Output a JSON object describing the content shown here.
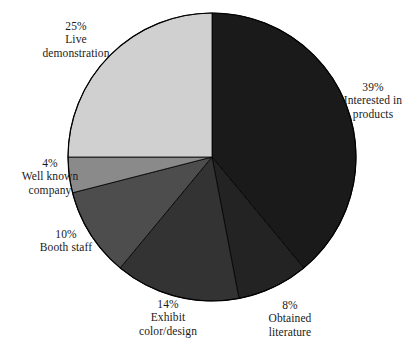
{
  "chart_data": {
    "type": "pie",
    "title": "",
    "subtitle": "",
    "xlabel": "",
    "ylabel": "",
    "legend_position": "none",
    "grid": false,
    "start_angle_deg": 0,
    "direction": "clockwise",
    "units": "percent",
    "total": 100,
    "categories": [
      "Interested in products",
      "Obtained literature",
      "Exhibit color/design",
      "Booth staff",
      "Well known company",
      "Live demonstration"
    ],
    "values": [
      39,
      8,
      14,
      10,
      4,
      25
    ],
    "colors": [
      "#1a1a1a",
      "#232323",
      "#333333",
      "#4d4d4d",
      "#8a8a8a",
      "#d0d0d0"
    ],
    "slices": [
      {
        "percent_text": "39%",
        "name_line1": "Interested in",
        "name_line2": "products",
        "name": "Interested in products",
        "value": 39,
        "color": "#1a1a1a",
        "start_deg": 0,
        "end_deg": 140.4
      },
      {
        "percent_text": "8%",
        "name_line1": "Obtained",
        "name_line2": "literature",
        "name": "Obtained literature",
        "value": 8,
        "color": "#232323",
        "start_deg": 140.4,
        "end_deg": 169.2
      },
      {
        "percent_text": "14%",
        "name_line1": "Exhibit",
        "name_line2": "color/design",
        "name": "Exhibit color/design",
        "value": 14,
        "color": "#333333",
        "start_deg": 169.2,
        "end_deg": 219.6
      },
      {
        "percent_text": "10%",
        "name_line1": "Booth staff",
        "name_line2": "",
        "name": "Booth staff",
        "value": 10,
        "color": "#4d4d4d",
        "start_deg": 219.6,
        "end_deg": 255.6
      },
      {
        "percent_text": "4%",
        "name_line1": "Well known",
        "name_line2": "company",
        "name": "Well known company",
        "value": 4,
        "color": "#8a8a8a",
        "start_deg": 255.6,
        "end_deg": 270.0
      },
      {
        "percent_text": "25%",
        "name_line1": "Live",
        "name_line2": "demonstration",
        "name": "Live demonstration",
        "value": 25,
        "color": "#d0d0d0",
        "start_deg": 270.0,
        "end_deg": 360.0
      }
    ],
    "geometry": {
      "center_x": 212,
      "center_y": 157,
      "radius": 144
    },
    "background_color": "#ffffff",
    "outline_color": "#000000"
  }
}
